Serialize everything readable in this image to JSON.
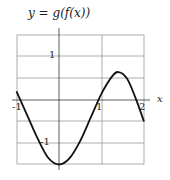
{
  "chart_data": {
    "type": "line",
    "title": "y = g(f(x))",
    "xlabel": "x",
    "ylabel": "",
    "xlim": [
      -1,
      2
    ],
    "ylim": [
      -1.5,
      1.5
    ],
    "grid": true,
    "x_ticks": [
      "-1",
      "1",
      "2"
    ],
    "y_ticks": [
      "1",
      "-1"
    ],
    "series": [
      {
        "name": "g(f(x))",
        "x": [
          -1,
          -0.75,
          -0.5,
          -0.25,
          0,
          0.25,
          0.5,
          0.75,
          1,
          1.25,
          1.4,
          1.6,
          1.8,
          2
        ],
        "y": [
          0.2,
          -0.35,
          -0.9,
          -1.35,
          -1.5,
          -1.35,
          -0.95,
          -0.4,
          0.15,
          0.55,
          0.65,
          0.5,
          0.05,
          -0.5
        ]
      }
    ]
  },
  "labels": {
    "title": "y = g(f(x))",
    "x_axis": "x",
    "x_neg1": "-1",
    "x_1": "1",
    "x_2": "2",
    "y_1": "1",
    "y_neg1": "-1"
  }
}
